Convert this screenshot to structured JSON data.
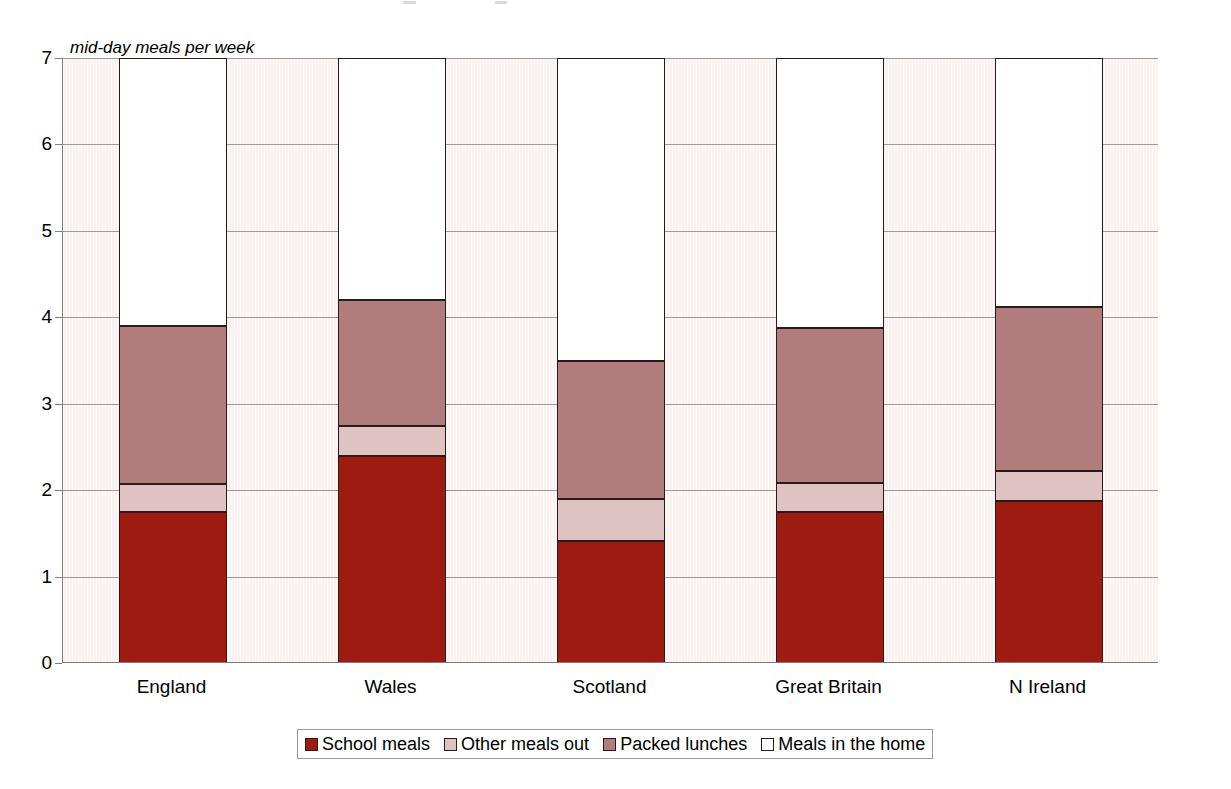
{
  "chart_data": {
    "type": "bar",
    "subtype": "stacked-bar",
    "title": "",
    "xlabel": "",
    "ylabel": "mid-day meals per week",
    "ylim": [
      0,
      7
    ],
    "yticks": [
      0,
      1,
      2,
      3,
      4,
      5,
      6,
      7
    ],
    "ytick_labels": [
      "0",
      "1",
      "2",
      "3",
      "4",
      "5",
      "6",
      "7"
    ],
    "grid": true,
    "grid_axis": "y",
    "legend_position": "bottom",
    "categories": [
      "England",
      "Wales",
      "Scotland",
      "Great Britain",
      "N Ireland"
    ],
    "series": [
      {
        "name": "School meals",
        "color": "#9e1b12",
        "values": [
          1.75,
          2.4,
          1.41,
          1.75,
          1.87
        ]
      },
      {
        "name": "Other meals out",
        "color": "#dfc3c3",
        "values": [
          0.32,
          0.34,
          0.49,
          0.33,
          0.35
        ]
      },
      {
        "name": "Packed lunches",
        "color": "#b07c7c",
        "values": [
          1.83,
          1.46,
          1.6,
          1.8,
          1.9
        ]
      },
      {
        "name": "Meals in the home",
        "color": "#ffffff",
        "values": [
          3.1,
          2.8,
          3.5,
          3.12,
          2.88
        ]
      }
    ],
    "totals": [
      7,
      7,
      7,
      7,
      7
    ],
    "plot_background": "#f9f0f0",
    "gridline_color": "#9a9a9a",
    "segment_border_color": "#2b1a1a"
  },
  "legend": {
    "items": [
      {
        "label": "School meals",
        "color": "#9e1b12"
      },
      {
        "label": "Other meals out",
        "color": "#dfc3c3"
      },
      {
        "label": "Packed lunches",
        "color": "#b07c7c"
      },
      {
        "label": "Meals in the home",
        "color": "#ffffff"
      }
    ]
  }
}
